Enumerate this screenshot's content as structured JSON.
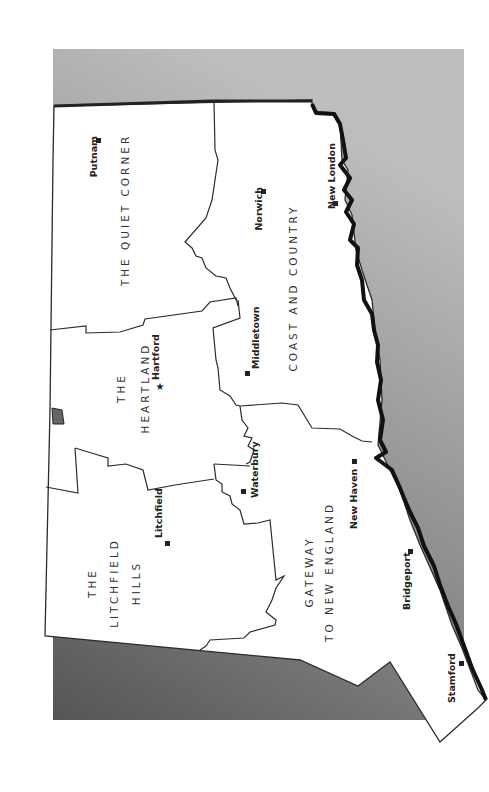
{
  "map": {
    "title": "Connecticut Tourism Regions",
    "orientation": "rotated 90° counter-clockwise (north at left)",
    "colors": {
      "land": "#ffffff",
      "border": "#2b2b2b",
      "coastline": "#111111",
      "water_light": "#b5b5b5",
      "water_dark": "#5a5a5a",
      "page_background": "#ffffff"
    },
    "regions": [
      {
        "id": "quiet-corner",
        "lines": [
          "THE QUIET CORNER"
        ]
      },
      {
        "id": "coast-and-country",
        "lines": [
          "COAST AND COUNTRY"
        ]
      },
      {
        "id": "heartland",
        "lines": [
          "THE",
          "HEARTLAND"
        ]
      },
      {
        "id": "litchfield-hills",
        "lines": [
          "THE",
          "LITCHFIELD",
          "HILLS"
        ]
      },
      {
        "id": "gateway",
        "lines": [
          "GATEWAY",
          "TO NEW ENGLAND"
        ]
      }
    ],
    "cities": [
      {
        "name": "Putnam",
        "marker": "square"
      },
      {
        "name": "Norwich",
        "marker": "square"
      },
      {
        "name": "New London",
        "marker": "square"
      },
      {
        "name": "Hartford",
        "marker": "star",
        "capital": true
      },
      {
        "name": "Middletown",
        "marker": "square"
      },
      {
        "name": "Waterbury",
        "marker": "square"
      },
      {
        "name": "Litchfield",
        "marker": "square"
      },
      {
        "name": "New Haven",
        "marker": "square"
      },
      {
        "name": "Bridgeport",
        "marker": "square"
      },
      {
        "name": "Stamford",
        "marker": "square"
      }
    ]
  }
}
